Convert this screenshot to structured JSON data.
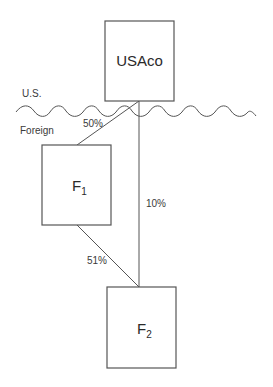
{
  "diagram": {
    "type": "ownership-structure",
    "border": {
      "upper_label": "U.S.",
      "lower_label": "Foreign"
    },
    "entities": [
      {
        "id": "usaco",
        "label": "USAco",
        "subscript": "",
        "x": 105,
        "y": 21,
        "w": 69,
        "h": 80
      },
      {
        "id": "f1",
        "label": "F",
        "subscript": "1",
        "x": 42,
        "y": 145,
        "w": 69,
        "h": 80
      },
      {
        "id": "f2",
        "label": "F",
        "subscript": "2",
        "x": 107,
        "y": 287,
        "w": 69,
        "h": 81
      }
    ],
    "ownership_links": [
      {
        "from": "USAco",
        "to": "F1",
        "percent": "50%"
      },
      {
        "from": "USAco",
        "to": "F2",
        "percent": "10%"
      },
      {
        "from": "F1",
        "to": "F2",
        "percent": "51%"
      }
    ],
    "colors": {
      "stroke": "#555555",
      "text": "#2a2a2a",
      "background": "#ffffff"
    }
  }
}
